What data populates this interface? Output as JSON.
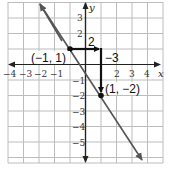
{
  "figure": {
    "type": "coordinate-plane-line",
    "axes": {
      "x_label": "x",
      "y_label": "y",
      "x_ticks": [
        "−4",
        "−3",
        "−2",
        "−1",
        "2",
        "3",
        "4"
      ],
      "y_ticks": [
        "3",
        "2",
        "−1",
        "−2",
        "−3",
        "−4",
        "−5"
      ]
    },
    "points": [
      {
        "label": "(−1, 1)",
        "x": -1,
        "y": 1
      },
      {
        "label": "(1, −2)",
        "x": 1,
        "y": -2
      }
    ],
    "slope_triangle": {
      "run_label": "2",
      "rise_label": "−3"
    },
    "line": {
      "slope": -1.5,
      "through": [
        -1,
        1
      ]
    },
    "colors": {
      "grid": "#b9b9b9",
      "axis": "#222222",
      "line": "#555555",
      "triangle": "#111111"
    }
  }
}
